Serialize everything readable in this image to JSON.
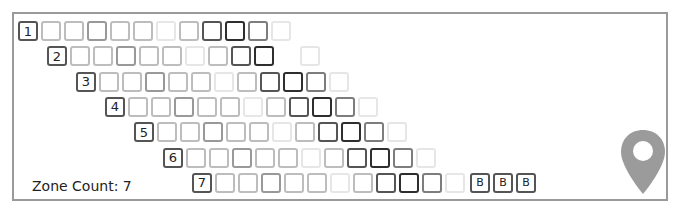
{
  "colors": {
    "frame": "#9a9a9a",
    "shades": {
      "vl": "#e6e6e6",
      "l": "#bdbdbd",
      "m": "#999999",
      "md": "#7d7d7d",
      "d": "#555555",
      "x": "#2e2e2e"
    },
    "pin": "#9b9b9b"
  },
  "rows": [
    {
      "label": "1",
      "cells": [
        "l",
        "l",
        "m",
        "l",
        "l",
        "vl",
        "l",
        "d",
        "x",
        "md",
        "vl"
      ]
    },
    {
      "label": "2",
      "cells": [
        "l",
        "l",
        "m",
        "l",
        "l",
        "vl",
        "l",
        "d",
        "x",
        "gap",
        "vl"
      ]
    },
    {
      "label": "3",
      "cells": [
        "l",
        "l",
        "m",
        "l",
        "l",
        "vl",
        "l",
        "d",
        "x",
        "md",
        "vl"
      ]
    },
    {
      "label": "4",
      "cells": [
        "l",
        "l",
        "m",
        "l",
        "l",
        "vl",
        "l",
        "d",
        "x",
        "md",
        "vl"
      ]
    },
    {
      "label": "5",
      "cells": [
        "l",
        "l",
        "m",
        "l",
        "l",
        "vl",
        "l",
        "d",
        "x",
        "md",
        "vl"
      ]
    },
    {
      "label": "6",
      "cells": [
        "l",
        "l",
        "m",
        "l",
        "l",
        "vl",
        "l",
        "d",
        "x",
        "md",
        "vl"
      ]
    },
    {
      "label": "7",
      "cells": [
        "l",
        "l",
        "m",
        "l",
        "l",
        "vl",
        "l",
        "d",
        "x",
        "md",
        "vl"
      ],
      "extra": [
        "B",
        "B",
        "B"
      ]
    }
  ],
  "zone_count": {
    "label": "Zone Count: 7"
  },
  "icons": {
    "pin": "map-pin-icon"
  }
}
